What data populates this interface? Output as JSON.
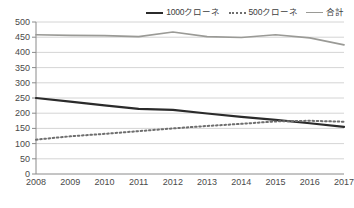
{
  "chart_data": {
    "type": "line",
    "title": "",
    "xlabel": "",
    "ylabel": "",
    "x": [
      2008,
      2009,
      2010,
      2011,
      2012,
      2013,
      2014,
      2015,
      2016,
      2017
    ],
    "xtick_labels": [
      "2008",
      "2009",
      "2010",
      "2011",
      "2012",
      "2013",
      "2014",
      "2015",
      "2016",
      "2017"
    ],
    "ytick_labels": [
      "0",
      "50",
      "100",
      "150",
      "200",
      "250",
      "300",
      "350",
      "400",
      "450",
      "500"
    ],
    "yticks": [
      0,
      50,
      100,
      150,
      200,
      250,
      300,
      350,
      400,
      450,
      500
    ],
    "ylim": [
      0,
      500
    ],
    "grid": true,
    "grid_axis": "y",
    "legend_position": "top-right",
    "series": [
      {
        "name": "1000クローネ",
        "style": "solid",
        "color": "#2b2b2b",
        "width": 2.2,
        "values": [
          250,
          238,
          226,
          214,
          211,
          199,
          188,
          178,
          167,
          155
        ]
      },
      {
        "name": "500クローネ",
        "style": "dotted",
        "color": "#6e6e6e",
        "width": 2.0,
        "values": [
          113,
          124,
          132,
          141,
          150,
          158,
          165,
          173,
          175,
          172
        ]
      },
      {
        "name": "合計",
        "style": "solid",
        "color": "#9a9a96",
        "width": 1.7,
        "values": [
          458,
          456,
          455,
          452,
          467,
          452,
          449,
          458,
          448,
          425
        ]
      }
    ]
  },
  "legend": {
    "items": [
      {
        "label": "1000クローネ",
        "swatch": "solid-dark-line-icon"
      },
      {
        "label": "500クローネ",
        "swatch": "dotted-line-icon"
      },
      {
        "label": "合計",
        "swatch": "solid-gray-line-icon"
      }
    ]
  }
}
